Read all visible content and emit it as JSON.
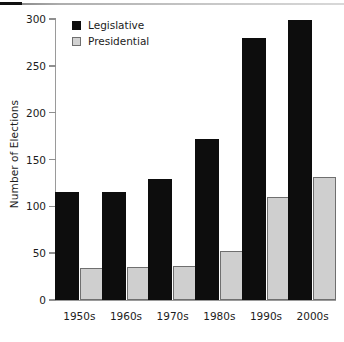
{
  "decor": {
    "top_rule": "horizontal-rule"
  },
  "chart_data": {
    "type": "bar",
    "title": "",
    "xlabel": "",
    "ylabel": "Number of Elections",
    "ylim": [
      0,
      300
    ],
    "yticks": [
      0,
      50,
      100,
      150,
      200,
      250,
      300
    ],
    "grid": false,
    "legend_position": "top-left",
    "categories": [
      "1950s",
      "1960s",
      "1970s",
      "1980s",
      "1990s",
      "2000s"
    ],
    "series": [
      {
        "name": "Legislative",
        "color": "#0d0d0d",
        "values": [
          115,
          115,
          129,
          172,
          280,
          299
        ]
      },
      {
        "name": "Presidential",
        "color": "#cfcfcf",
        "values": [
          34,
          35,
          36,
          52,
          110,
          131
        ]
      }
    ]
  }
}
